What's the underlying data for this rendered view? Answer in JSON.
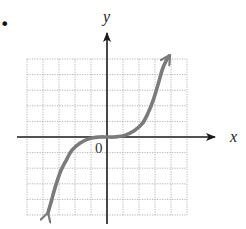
{
  "figure": {
    "bullet": "•",
    "x_axis_label": "x",
    "y_axis_label": "y",
    "origin_label": "0"
  },
  "colors": {
    "grid": "#b4b4b4",
    "axes": "#1a1a1a",
    "curve": "#7b7b7b",
    "labels": "#222222"
  },
  "chart_data": {
    "type": "line",
    "title": "",
    "xlabel": "x",
    "ylabel": "y",
    "grid": true,
    "grid_cells": {
      "x": [
        -5,
        5
      ],
      "y": [
        -5,
        5
      ]
    },
    "xlim": [
      -5,
      5
    ],
    "ylim": [
      -5,
      5
    ],
    "tick_labels": [
      "0"
    ],
    "arrows": {
      "upper_end": [
        3.9,
        5.2
      ],
      "lower_end": [
        -3.7,
        -4.9
      ]
    },
    "series": [
      {
        "name": "curve",
        "x": [
          -3.7,
          -3.45,
          -3.2,
          -2.9,
          -2.55,
          -2.2,
          -1.7,
          -1.1,
          -0.45,
          0,
          0.45,
          1.1,
          1.7,
          2.2,
          2.55,
          2.9,
          3.2,
          3.45,
          3.7,
          3.9
        ],
        "y": [
          -4.9,
          -4.0,
          -3.1,
          -2.2,
          -1.5,
          -0.85,
          -0.4,
          -0.1,
          0.0,
          0.0,
          0.0,
          0.1,
          0.4,
          0.85,
          1.5,
          2.4,
          3.4,
          4.3,
          4.9,
          5.2
        ]
      }
    ]
  }
}
